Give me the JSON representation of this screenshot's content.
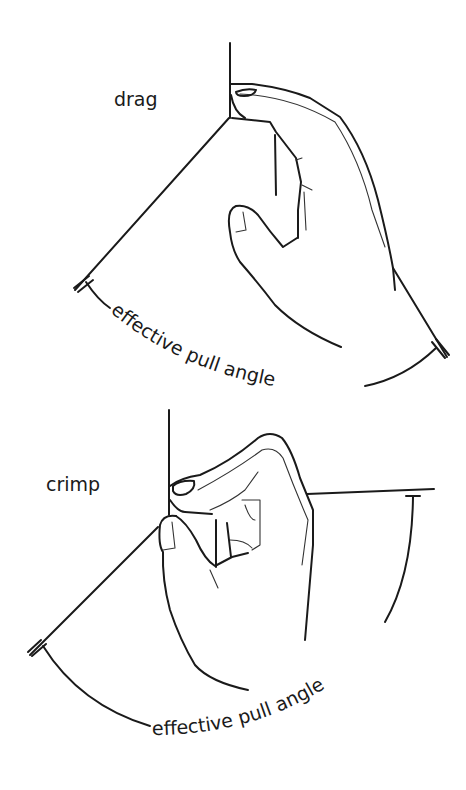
{
  "figure": {
    "panels": [
      {
        "id": "drag",
        "title": "drag",
        "angle_label": "effective pull angle"
      },
      {
        "id": "crimp",
        "title": "crimp",
        "angle_label": "effective pull angle"
      }
    ],
    "ink_color": "#1a1a1a",
    "background": "#ffffff"
  }
}
